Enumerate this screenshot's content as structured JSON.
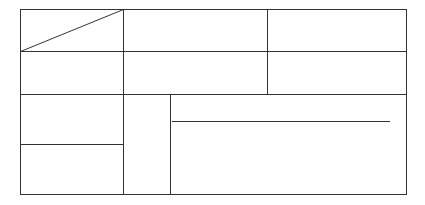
{
  "diagram": {
    "type": "table-grid",
    "stroke_color": "#333333",
    "background": "#ffffff",
    "outer_box": {
      "x1": 20,
      "y1": 9,
      "x2": 406,
      "y2": 194
    },
    "diagonal": {
      "x1": 20,
      "y1": 51,
      "x2": 123,
      "y2": 9
    },
    "rows": [
      9,
      51,
      94,
      194
    ],
    "columns": {
      "top_section": [
        20,
        123,
        267,
        406
      ],
      "bottom_section": [
        20,
        123,
        170,
        406
      ]
    },
    "left_bottom_split_y": 144,
    "inner_rule": {
      "x1": 172,
      "x2": 390,
      "y": 121
    },
    "cells": []
  }
}
